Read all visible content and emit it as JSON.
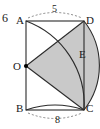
{
  "figure": {
    "problem_number": "6",
    "vertices": [
      {
        "id": "A",
        "label": "A",
        "x": 26,
        "y": 21
      },
      {
        "id": "B",
        "label": "B",
        "x": 26,
        "y": 110
      },
      {
        "id": "C",
        "label": "C",
        "x": 84,
        "y": 110
      },
      {
        "id": "D",
        "label": "D",
        "x": 84,
        "y": 21
      },
      {
        "id": "O",
        "label": "O",
        "x": 26,
        "y": 66
      },
      {
        "id": "E",
        "label": "E",
        "x": 76,
        "y": 58
      }
    ],
    "labels": {
      "A": "A",
      "B": "B",
      "C": "C",
      "D": "D",
      "E": "E",
      "O": "O",
      "top_measure": "5",
      "bottom_measure": "8"
    },
    "colors": {
      "stroke": "#2b2b2b",
      "shaded_region_fill": "#c9c9c9",
      "dashed_arc": "#6f6f6f",
      "background": "#ffffff",
      "point_marker": "#000000"
    },
    "elements": {
      "rectangle": "ABCD",
      "center_point": "O",
      "shaded_region": "O-D-E-C sector",
      "arc_upper": "A to C",
      "arc_lower": "B to C",
      "arc_DEC": "D through E to C",
      "dashed_arc_top": "A to D labeled 5",
      "dashed_arc_bottom": "B to C labeled 8"
    }
  }
}
